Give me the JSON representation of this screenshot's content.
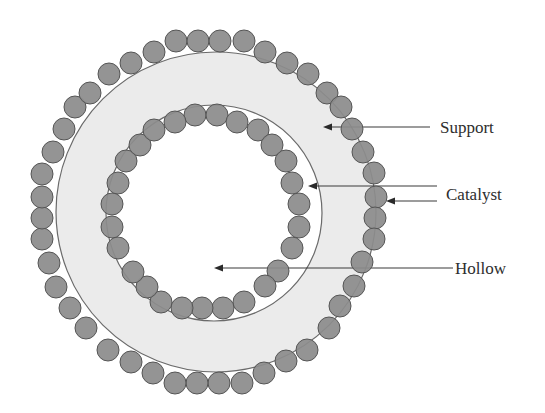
{
  "diagram": {
    "colors": {
      "support_fill": "#ebebeb",
      "ring_stroke": "#6a6a6a",
      "particle_fill": "#8c8c8c",
      "particle_stroke": "#555555",
      "hollow_fill": "#ffffff",
      "label_color": "#2e2e2e"
    },
    "geometry": {
      "outer_ring": {
        "cx": 216,
        "cy": 212,
        "r": 160
      },
      "inner_ring": {
        "cx": 214,
        "cy": 213,
        "r": 108
      },
      "particle_radius": 11
    },
    "outer_particles": [
      [
        176,
        41
      ],
      [
        198,
        41
      ],
      [
        220,
        41
      ],
      [
        244,
        41
      ],
      [
        265,
        52
      ],
      [
        287,
        63
      ],
      [
        308,
        74
      ],
      [
        327,
        93
      ],
      [
        341,
        107
      ],
      [
        352,
        129
      ],
      [
        363,
        152
      ],
      [
        374,
        173
      ],
      [
        376,
        197
      ],
      [
        375,
        218
      ],
      [
        374,
        239
      ],
      [
        362,
        262
      ],
      [
        354,
        286
      ],
      [
        340,
        306
      ],
      [
        329,
        328
      ],
      [
        307,
        350
      ],
      [
        286,
        361
      ],
      [
        264,
        373
      ],
      [
        242,
        383
      ],
      [
        219,
        383
      ],
      [
        197,
        383
      ],
      [
        175,
        383
      ],
      [
        153,
        373
      ],
      [
        131,
        362
      ],
      [
        108,
        350
      ],
      [
        86,
        328
      ],
      [
        70,
        308
      ],
      [
        56,
        287
      ],
      [
        49,
        263
      ],
      [
        42,
        239
      ],
      [
        42,
        218
      ],
      [
        42,
        197
      ],
      [
        42,
        174
      ],
      [
        53,
        152
      ],
      [
        64,
        129
      ],
      [
        75,
        107
      ],
      [
        90,
        93
      ],
      [
        109,
        74
      ],
      [
        131,
        63
      ],
      [
        154,
        52
      ]
    ],
    "inner_particles": [
      [
        195,
        115
      ],
      [
        217,
        115
      ],
      [
        237,
        122
      ],
      [
        258,
        130
      ],
      [
        272,
        145
      ],
      [
        286,
        161
      ],
      [
        292,
        183
      ],
      [
        299,
        204
      ],
      [
        299,
        227
      ],
      [
        292,
        248
      ],
      [
        278,
        271
      ],
      [
        265,
        286
      ],
      [
        244,
        302
      ],
      [
        223,
        308
      ],
      [
        202,
        308
      ],
      [
        182,
        308
      ],
      [
        161,
        302
      ],
      [
        147,
        287
      ],
      [
        133,
        272
      ],
      [
        118,
        248
      ],
      [
        112,
        227
      ],
      [
        112,
        204
      ],
      [
        118,
        183
      ],
      [
        126,
        161
      ],
      [
        140,
        145
      ],
      [
        154,
        130
      ],
      [
        175,
        122
      ]
    ],
    "labels": {
      "support": "Support",
      "catalyst": "Catalyst",
      "hollow": "Hollow"
    },
    "leaders": [
      {
        "name": "support-leader",
        "x1": 430,
        "y1": 127,
        "x2": 323,
        "y2": 127
      },
      {
        "name": "catalyst-inner-leader",
        "x1": 437,
        "y1": 186,
        "x2": 308,
        "y2": 186
      },
      {
        "name": "catalyst-outer-leader",
        "x1": 437,
        "y1": 201,
        "x2": 386,
        "y2": 201
      },
      {
        "name": "hollow-leader",
        "x1": 453,
        "y1": 268,
        "x2": 214,
        "y2": 268
      }
    ]
  }
}
